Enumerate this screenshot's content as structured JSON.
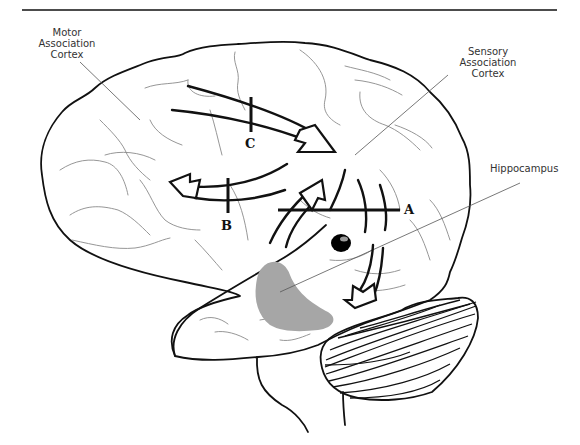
{
  "figure": {
    "type": "brain-lateral-view",
    "labels": {
      "motor": [
        "Motor",
        "Association",
        "Cortex"
      ],
      "sensory": [
        "Sensory",
        "Association",
        "Cortex"
      ],
      "hippocampus": "Hippocampus"
    },
    "lesion_markers": {
      "a": "A",
      "b": "B",
      "c": "C"
    },
    "colors": {
      "outline": "#111111",
      "sulci": "#8a8a8a",
      "hippocampus_fill": "#a6a6a6",
      "amygdala_fill": "#000000",
      "background": "#ffffff"
    }
  }
}
